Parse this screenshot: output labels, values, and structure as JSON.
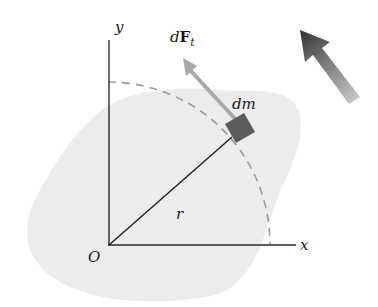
{
  "figure": {
    "type": "rigid body rotation diagram",
    "labels": {
      "y_axis": "y",
      "x_axis": "x",
      "origin": "O",
      "radius": "r",
      "mass_element": "dm",
      "force_prefix": "d",
      "force_symbol": "F",
      "force_subscript": "t"
    },
    "colors": {
      "body_fill": "#ededed",
      "axis": "#2a2a2a",
      "dashed_arc": "#9a9a9a",
      "mass_element": "#5c5c5c",
      "force_arrow": "#a8a8a8",
      "rotation_arrow_dark": "#3a3a3a",
      "rotation_arrow_light": "#b8b8b8"
    },
    "rotation_direction": "counterclockwise"
  }
}
